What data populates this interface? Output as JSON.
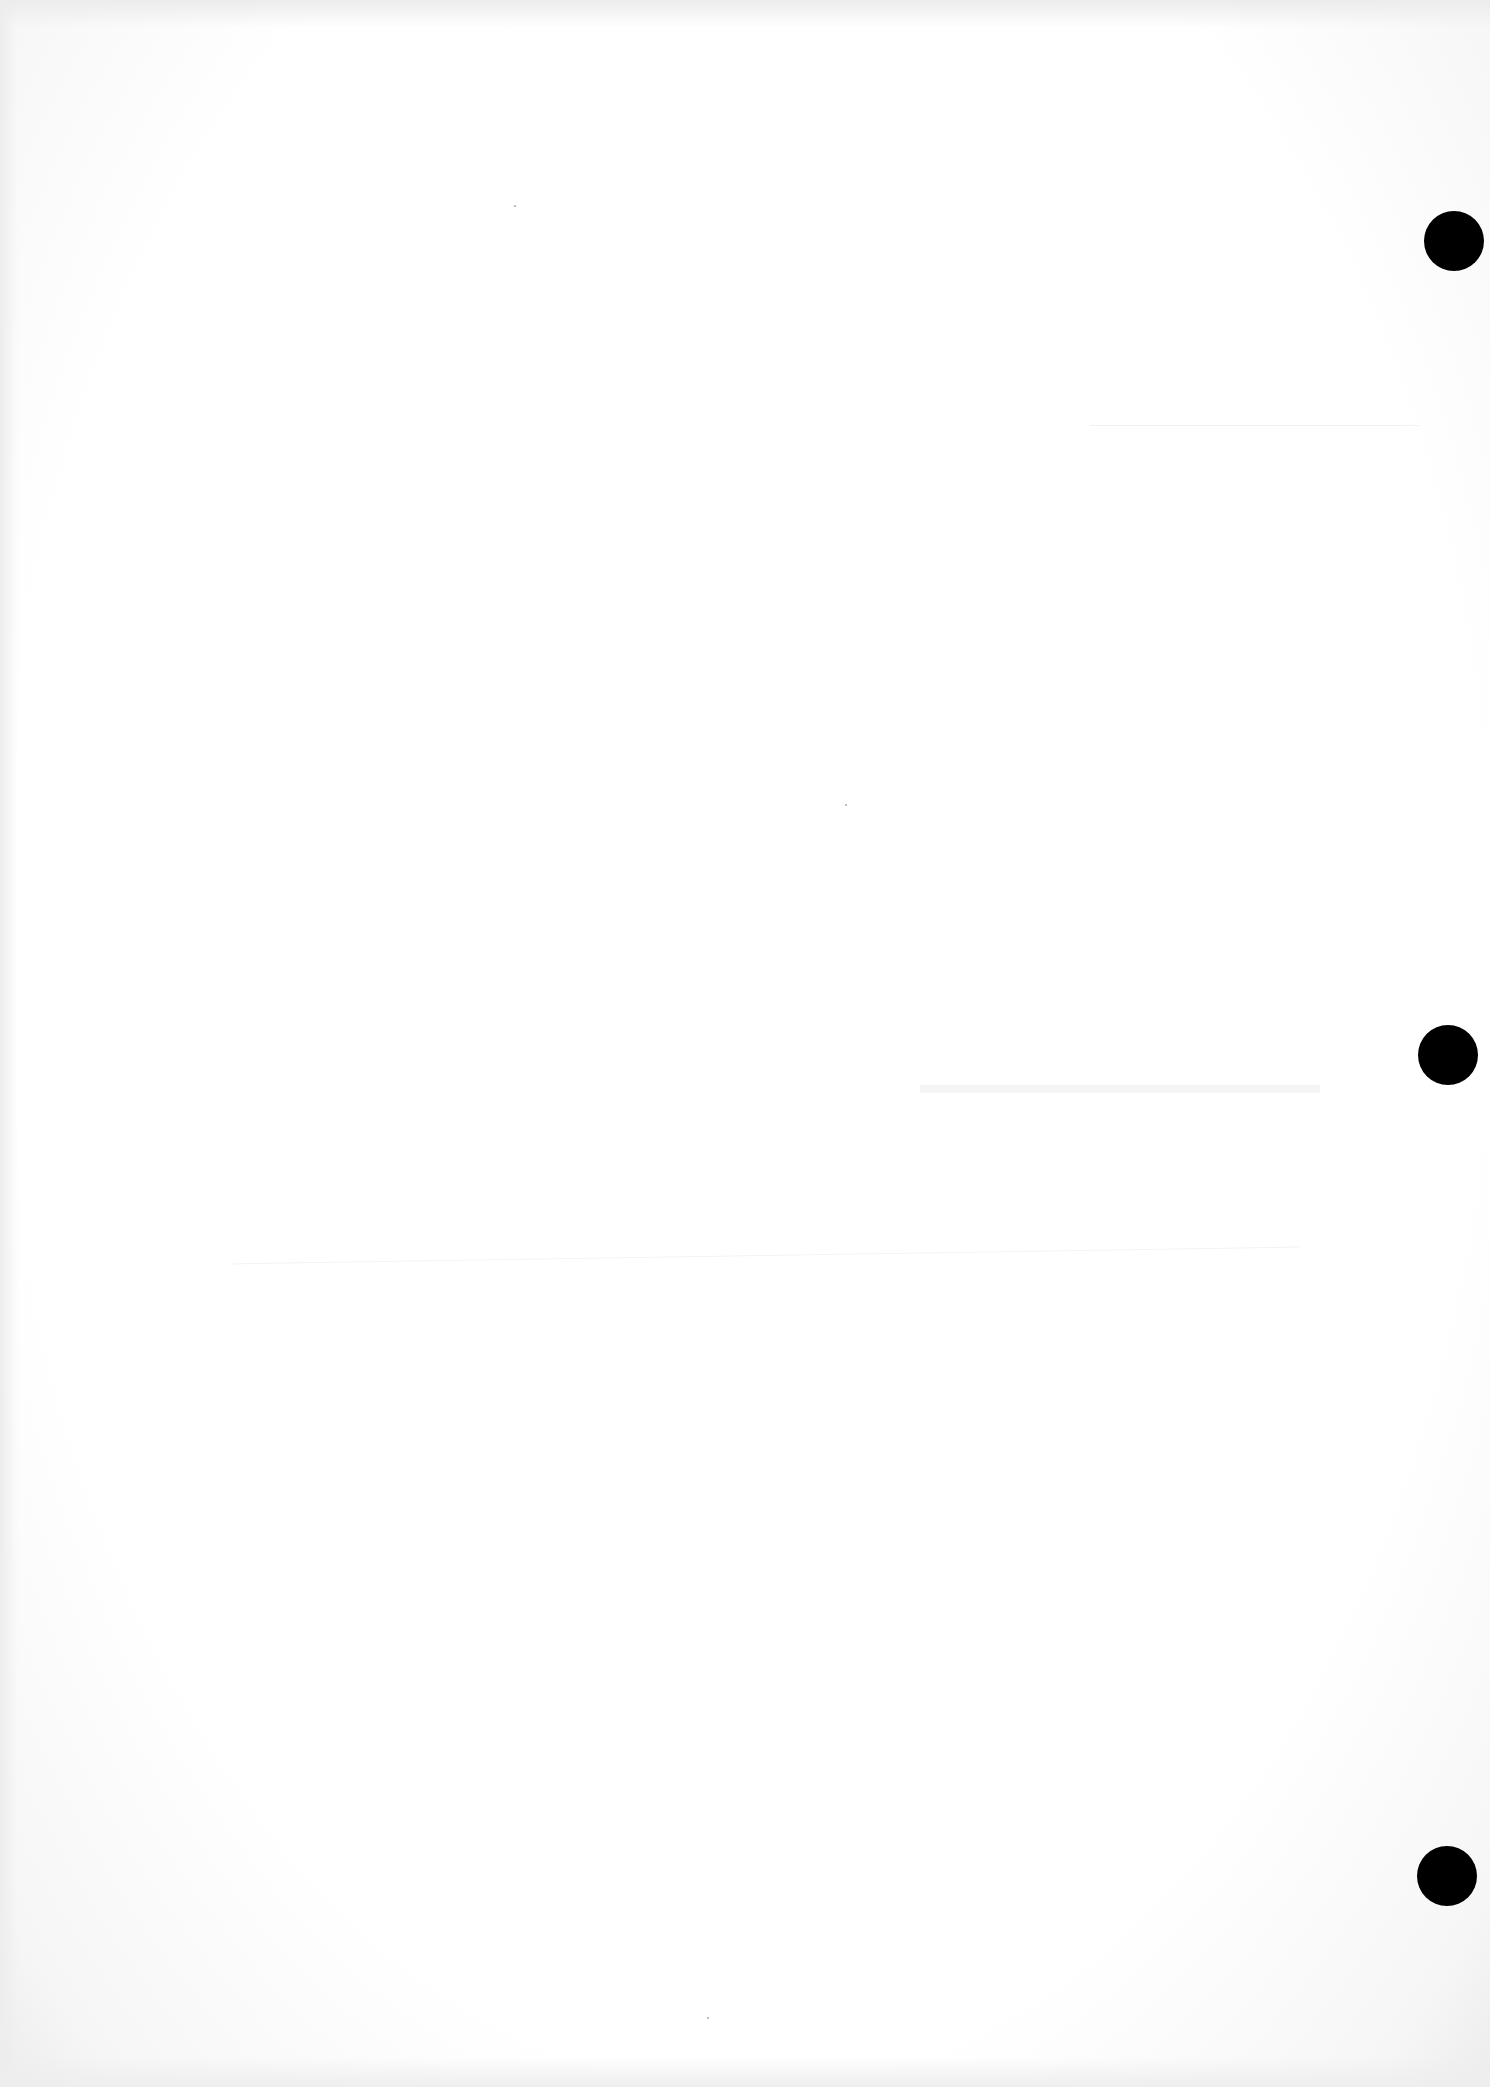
{
  "document": {
    "type": "blank scanned page",
    "background_color": "#ffffff",
    "punch_holes": [
      {
        "label": "top",
        "cx": 1454,
        "cy": 241,
        "diameter": 60,
        "color": "#000000"
      },
      {
        "label": "middle",
        "cx": 1448,
        "cy": 1055,
        "diameter": 60,
        "color": "#000000"
      },
      {
        "label": "bottom",
        "cx": 1447,
        "cy": 1876,
        "diameter": 60,
        "color": "#000000"
      }
    ],
    "text_content": []
  }
}
